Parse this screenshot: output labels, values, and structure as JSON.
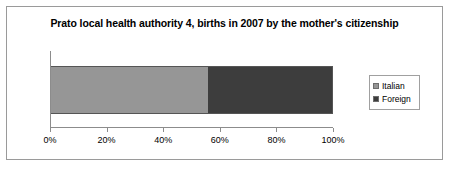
{
  "chart_data": {
    "type": "bar",
    "orientation": "horizontal",
    "stacked": true,
    "title": "Prato local health authority 4, births in 2007 by the mother's citizenship",
    "xlabel": "",
    "ylabel": "",
    "categories": [
      "Births 2007"
    ],
    "series": [
      {
        "name": "Italian",
        "values": [
          56
        ],
        "color": "#969696"
      },
      {
        "name": "Foreign",
        "values": [
          44
        ],
        "color": "#3d3d3d"
      }
    ],
    "xlim": [
      0,
      100
    ],
    "xticks": [
      0,
      20,
      40,
      60,
      80,
      100
    ],
    "xticklabels": [
      "0%",
      "20%",
      "40%",
      "60%",
      "80%",
      "100%"
    ],
    "grid": false,
    "legend_position": "right",
    "legend": [
      "Italian",
      "Foreign"
    ]
  },
  "chart": {
    "title": "Prato local health authority 4, births in 2007 by the mother's citizenship",
    "axis": {
      "ticks": [
        {
          "label": "0%",
          "value": 0
        },
        {
          "label": "20%",
          "value": 20
        },
        {
          "label": "40%",
          "value": 40
        },
        {
          "label": "60%",
          "value": 60
        },
        {
          "label": "80%",
          "value": 80
        },
        {
          "label": "100%",
          "value": 100
        }
      ]
    },
    "legend": {
      "items": [
        {
          "label": "Italian",
          "color": "#969696"
        },
        {
          "label": "Foreign",
          "color": "#3d3d3d"
        }
      ]
    },
    "bar": {
      "segments": [
        {
          "name": "Italian",
          "percent": 56,
          "color": "#969696"
        },
        {
          "name": "Foreign",
          "percent": 44,
          "color": "#3d3d3d"
        }
      ]
    }
  }
}
